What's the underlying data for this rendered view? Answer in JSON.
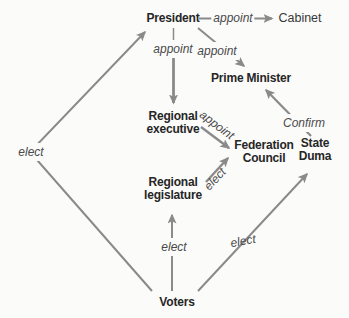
{
  "diagram": {
    "nodes": [
      {
        "id": "president",
        "label": "President"
      },
      {
        "id": "cabinet",
        "label": "Cabinet"
      },
      {
        "id": "prime-minister",
        "label": "Prime Minister"
      },
      {
        "id": "regional-executive",
        "label": "Regional executive"
      },
      {
        "id": "federation-council",
        "label": "Federation Council"
      },
      {
        "id": "state-duma",
        "label": "State Duma"
      },
      {
        "id": "regional-legislature",
        "label": "Regional legislature"
      },
      {
        "id": "voters",
        "label": "Voters"
      }
    ],
    "edges": [
      {
        "from": "President",
        "to": "Cabinet",
        "label": "appoint"
      },
      {
        "from": "President",
        "to": "Regional executive",
        "label": "appoint"
      },
      {
        "from": "President",
        "to": "Prime Minister",
        "label": "appoint"
      },
      {
        "from": "Regional executive",
        "to": "Federation Council",
        "label": "appoint"
      },
      {
        "from": "Regional legislature",
        "to": "Federation Council",
        "label": "elect"
      },
      {
        "from": "State Duma",
        "to": "Prime Minister",
        "label": "Confirm"
      },
      {
        "from": "Voters",
        "to": "President",
        "label": "elect"
      },
      {
        "from": "Voters",
        "to": "Regional legislature",
        "label": "elect"
      },
      {
        "from": "Voters",
        "to": "State Duma",
        "label": "elect"
      }
    ],
    "colors": {
      "arrow": "#8a8a8a",
      "node_text": "#262626",
      "edge_label_text": "#4a4a4a",
      "background": "#fbfbfa"
    }
  }
}
